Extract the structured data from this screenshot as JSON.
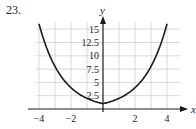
{
  "problem_number": "23.",
  "chart_data": {
    "type": "line",
    "title": "",
    "xlabel": "x",
    "ylabel": "y",
    "xlim": [
      -4.4,
      4.4
    ],
    "ylim": [
      0,
      16.5
    ],
    "x_ticks": [
      -4,
      -2,
      2,
      4
    ],
    "x_tick_labels": [
      "−4",
      "−2",
      "2",
      "4"
    ],
    "y_ticks": [
      2.5,
      5,
      7.5,
      10,
      12.5,
      15
    ],
    "y_tick_labels": [
      "2.5",
      "5",
      "7.5",
      "10",
      "12.5",
      "15"
    ],
    "grid": true,
    "series": [
      {
        "name": "f(x)",
        "x": [
          -4,
          -3,
          -2,
          -1,
          0,
          1,
          2,
          3,
          4
        ],
        "values": [
          16,
          8,
          4,
          2,
          1,
          2,
          4,
          8,
          16
        ]
      }
    ],
    "colors": {
      "curve": "#1a1a1a",
      "grid": "#cfcfcf",
      "axis": "#1a1a1a"
    }
  }
}
